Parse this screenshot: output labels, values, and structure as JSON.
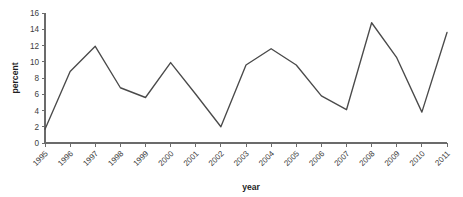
{
  "chart_data": {
    "type": "line",
    "title": "",
    "xlabel": "year",
    "ylabel": "percent",
    "categories": [
      "1995",
      "1996",
      "1997",
      "1998",
      "1999",
      "2000",
      "2001",
      "2002",
      "2003",
      "2004",
      "2005",
      "2006",
      "2007",
      "2008",
      "2009",
      "2010",
      "2011"
    ],
    "values": [
      1.7,
      8.8,
      11.9,
      6.8,
      5.6,
      9.9,
      6.0,
      2.0,
      9.6,
      11.6,
      9.6,
      5.8,
      4.1,
      14.8,
      10.5,
      3.8,
      13.6
    ],
    "series": [
      {
        "name": "percent",
        "values": [
          1.7,
          8.8,
          11.9,
          6.8,
          5.6,
          9.9,
          6.0,
          2.0,
          9.6,
          11.6,
          9.6,
          5.8,
          4.1,
          14.8,
          10.5,
          3.8,
          13.6
        ]
      }
    ],
    "yticks": [
      0,
      2,
      4,
      6,
      8,
      10,
      12,
      14,
      16
    ],
    "ytick_labels": [
      "0",
      "2",
      "4",
      "6",
      "8",
      "10",
      "12",
      "14",
      "16"
    ],
    "ylim": [
      0,
      16
    ],
    "xlim": [
      "1995",
      "2011"
    ],
    "grid": false,
    "legend": false,
    "legend_position": "none",
    "line_color": "#4a4a4a",
    "axis_color": "#6b6b6b",
    "background_color": "#ffffff",
    "xtick_rotation": -45
  }
}
